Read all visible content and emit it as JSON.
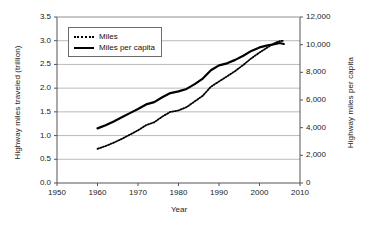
{
  "chart_data": {
    "type": "line",
    "title": "",
    "xlabel": "Year",
    "ylabel": "Highway miles traveled (trillion)",
    "ylabel_right": "Highway miles per capita",
    "xlim": [
      1950,
      2010
    ],
    "ylim": [
      0.0,
      3.5
    ],
    "ylim_right": [
      0,
      12000
    ],
    "grid": "horizontal",
    "legend_position": "upper-left",
    "xticks": [
      "1950",
      "1960",
      "1970",
      "1980",
      "1990",
      "2000",
      "2010"
    ],
    "xtick_values": [
      1950,
      1960,
      1970,
      1980,
      1990,
      2000,
      2010
    ],
    "yticks": [
      "0.0",
      "0.5",
      "1.0",
      "1.5",
      "2.0",
      "2.5",
      "3.0",
      "3.5"
    ],
    "ytick_values": [
      0.0,
      0.5,
      1.0,
      1.5,
      2.0,
      2.5,
      3.0,
      3.5
    ],
    "yticks_right": [
      "0",
      "2,000",
      "4,000",
      "6,000",
      "8,000",
      "10,000",
      "12,000"
    ],
    "ytick_values_right": [
      0,
      2000,
      4000,
      6000,
      8000,
      10000,
      12000
    ],
    "x": [
      1960,
      1962,
      1964,
      1966,
      1968,
      1970,
      1972,
      1974,
      1976,
      1978,
      1980,
      1982,
      1984,
      1986,
      1988,
      1990,
      1992,
      1994,
      1996,
      1998,
      2000,
      2002,
      2004,
      2005,
      2006
    ],
    "series": [
      {
        "name": "Miles",
        "axis": "left",
        "style": "dotted",
        "units": "trillion miles",
        "values": [
          0.72,
          0.78,
          0.85,
          0.93,
          1.02,
          1.11,
          1.22,
          1.28,
          1.4,
          1.5,
          1.53,
          1.6,
          1.72,
          1.84,
          2.03,
          2.14,
          2.25,
          2.36,
          2.49,
          2.63,
          2.75,
          2.86,
          2.96,
          2.99,
          3.0
        ]
      },
      {
        "name": "Miles per capita",
        "axis": "right",
        "style": "solid",
        "units": "miles per capita",
        "values": [
          3950,
          4180,
          4450,
          4750,
          5050,
          5350,
          5680,
          5850,
          6200,
          6500,
          6620,
          6800,
          7150,
          7550,
          8150,
          8500,
          8650,
          8900,
          9200,
          9550,
          9800,
          9950,
          10050,
          10120,
          10050
        ]
      }
    ]
  }
}
